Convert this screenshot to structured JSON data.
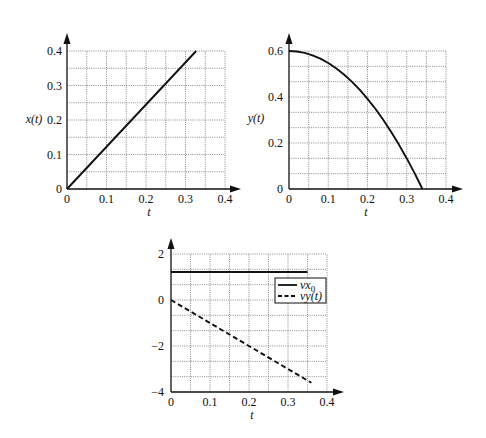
{
  "chart_data": [
    {
      "id": "chart-x-of-t",
      "type": "line",
      "title": "",
      "xlabel": "t",
      "ylabel": "x(t)",
      "xlim": [
        0,
        0.4
      ],
      "ylim": [
        0,
        0.4
      ],
      "xticks": [
        0,
        0.1,
        0.2,
        0.3,
        0.4
      ],
      "xtick_labels": [
        "0",
        "0.1",
        "0.2",
        "0.3",
        "0.4"
      ],
      "yticks": [
        0,
        0.1,
        0.2,
        0.3,
        0.4
      ],
      "ytick_labels": [
        "0",
        "0.1",
        "0.2",
        "0.3",
        "0.4"
      ],
      "grid": {
        "on": true,
        "style": "dotted",
        "x_divisions": 8,
        "y_divisions": 8
      },
      "series": [
        {
          "name": "x(t)",
          "style": "solid",
          "x": [
            0,
            0.327
          ],
          "y": [
            0,
            0.4
          ]
        }
      ],
      "legend": null
    },
    {
      "id": "chart-y-of-t",
      "type": "line",
      "title": "",
      "xlabel": "t",
      "ylabel": "y(t)",
      "xlim": [
        0,
        0.4
      ],
      "ylim": [
        0,
        0.6
      ],
      "xticks": [
        0,
        0.1,
        0.2,
        0.3,
        0.4
      ],
      "xtick_labels": [
        "0",
        "0.1",
        "0.2",
        "0.3",
        "0.4"
      ],
      "yticks": [
        0,
        0.2,
        0.4,
        0.6
      ],
      "ytick_labels": [
        "0",
        "0.2",
        "0.4",
        "0.6"
      ],
      "grid": {
        "on": true,
        "style": "dotted",
        "x_divisions": 8,
        "y_divisions": 9
      },
      "series": [
        {
          "name": "y(t)",
          "style": "solid",
          "x": [
            0,
            0.02,
            0.04,
            0.06,
            0.08,
            0.1,
            0.12,
            0.14,
            0.16,
            0.18,
            0.2,
            0.22,
            0.24,
            0.26,
            0.28,
            0.3,
            0.32,
            0.34
          ],
          "y": [
            0.6,
            0.598,
            0.592,
            0.581,
            0.567,
            0.548,
            0.525,
            0.498,
            0.467,
            0.432,
            0.392,
            0.349,
            0.301,
            0.249,
            0.193,
            0.133,
            0.069,
            0.0
          ]
        }
      ],
      "legend": null
    },
    {
      "id": "chart-velocity",
      "type": "line",
      "title": "",
      "xlabel": "t",
      "ylabel": "",
      "xlim": [
        0,
        0.4
      ],
      "ylim": [
        -4,
        2
      ],
      "xticks": [
        0,
        0.1,
        0.2,
        0.3,
        0.4
      ],
      "xtick_labels": [
        "0",
        "0.1",
        "0.2",
        "0.3",
        "0.4"
      ],
      "yticks": [
        -4,
        -2,
        0,
        2
      ],
      "ytick_labels": [
        "−4",
        "−2",
        "0",
        "2"
      ],
      "grid": {
        "on": true,
        "style": "dotted",
        "x_divisions": 8,
        "y_divisions": 9
      },
      "series": [
        {
          "name": "vx0",
          "style": "solid",
          "x": [
            0,
            0.35
          ],
          "y": [
            1.22,
            1.22
          ]
        },
        {
          "name": "vy(t)",
          "style": "dashed",
          "x": [
            0,
            0.36
          ],
          "y": [
            0,
            -3.6
          ]
        }
      ],
      "legend": {
        "position": "upper right",
        "entries": [
          {
            "label": "vx",
            "sub": "0",
            "style": "solid"
          },
          {
            "label": "vy(t)",
            "sub": "",
            "style": "dashed"
          }
        ]
      }
    }
  ]
}
